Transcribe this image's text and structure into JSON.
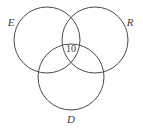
{
  "figure": {
    "type": "venn-diagram-3-set",
    "background_color": "#ffffff",
    "stroke_color": "#4a4a4a",
    "text_color": "#3c3c3c",
    "width": 143,
    "height": 131
  },
  "chart_data": {
    "type": "venn",
    "title": "",
    "xlabel": "",
    "ylabel": "",
    "set_count": 3,
    "sets": [
      {
        "id": "E",
        "label": "E",
        "cx": 47,
        "cy": 40,
        "r": 33,
        "label_x": 11,
        "label_y": 23
      },
      {
        "id": "R",
        "label": "R",
        "cx": 95,
        "cy": 40,
        "r": 33,
        "label_x": 130,
        "label_y": 23
      },
      {
        "id": "D",
        "label": "D",
        "cx": 71,
        "cy": 77,
        "r": 33,
        "label_x": 71,
        "label_y": 120
      }
    ],
    "regions": [
      {
        "id": "E-R-D",
        "sets": [
          "E",
          "R",
          "D"
        ],
        "label": "10",
        "value": 10,
        "x": 71,
        "y": 50
      }
    ],
    "legend": "none",
    "grid": false
  }
}
